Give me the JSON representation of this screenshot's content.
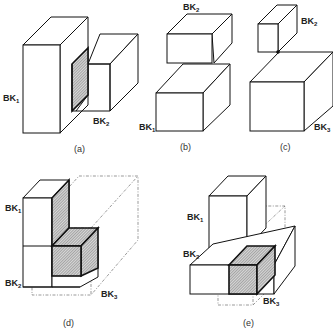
{
  "figure": {
    "panels": [
      {
        "id": "a",
        "caption": "(a)",
        "labels": [
          {
            "base": "BK",
            "sub": "1"
          },
          {
            "base": "BK",
            "sub": "2"
          }
        ]
      },
      {
        "id": "b",
        "caption": "(b)",
        "labels": [
          {
            "base": "BK",
            "sub": "2"
          },
          {
            "base": "BK",
            "sub": "1"
          }
        ]
      },
      {
        "id": "c",
        "caption": "(c)",
        "labels": [
          {
            "base": "BK",
            "sub": "2"
          },
          {
            "base": "BK",
            "sub": "3"
          }
        ]
      },
      {
        "id": "d",
        "caption": "(d)",
        "labels": [
          {
            "base": "BK",
            "sub": "1"
          },
          {
            "base": "BK",
            "sub": "2"
          },
          {
            "base": "BK",
            "sub": "3"
          }
        ]
      },
      {
        "id": "e",
        "caption": "(e)",
        "labels": [
          {
            "base": "BK",
            "sub": "1"
          },
          {
            "base": "BK",
            "sub": "2"
          },
          {
            "base": "BK",
            "sub": "3"
          }
        ]
      }
    ],
    "colors": {
      "line": "#111111",
      "hatch": "#555555",
      "background": "#ffffff"
    }
  }
}
